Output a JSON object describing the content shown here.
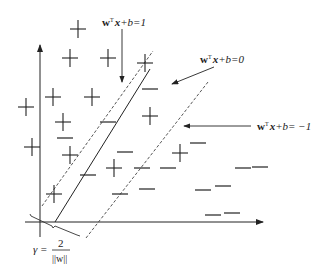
{
  "diagram": {
    "positive_symbol": "+",
    "negative_symbol": "−",
    "positive_count": 15,
    "negative_count": 17,
    "labels": {
      "upper_margin": {
        "w": "w",
        "T": "T",
        "x": "x",
        "rest": "+b=1"
      },
      "hyperplane": {
        "w": "w",
        "T": "T",
        "x": "x",
        "rest": "+b=0"
      },
      "lower_margin": {
        "w": "w",
        "T": "T",
        "x": "x",
        "rest": "+b= −1"
      },
      "margin": {
        "gamma": "γ =",
        "numerator": "2",
        "denominator": "||w||"
      }
    },
    "colors": {
      "ink": "#222222",
      "background": "#ffffff"
    }
  }
}
